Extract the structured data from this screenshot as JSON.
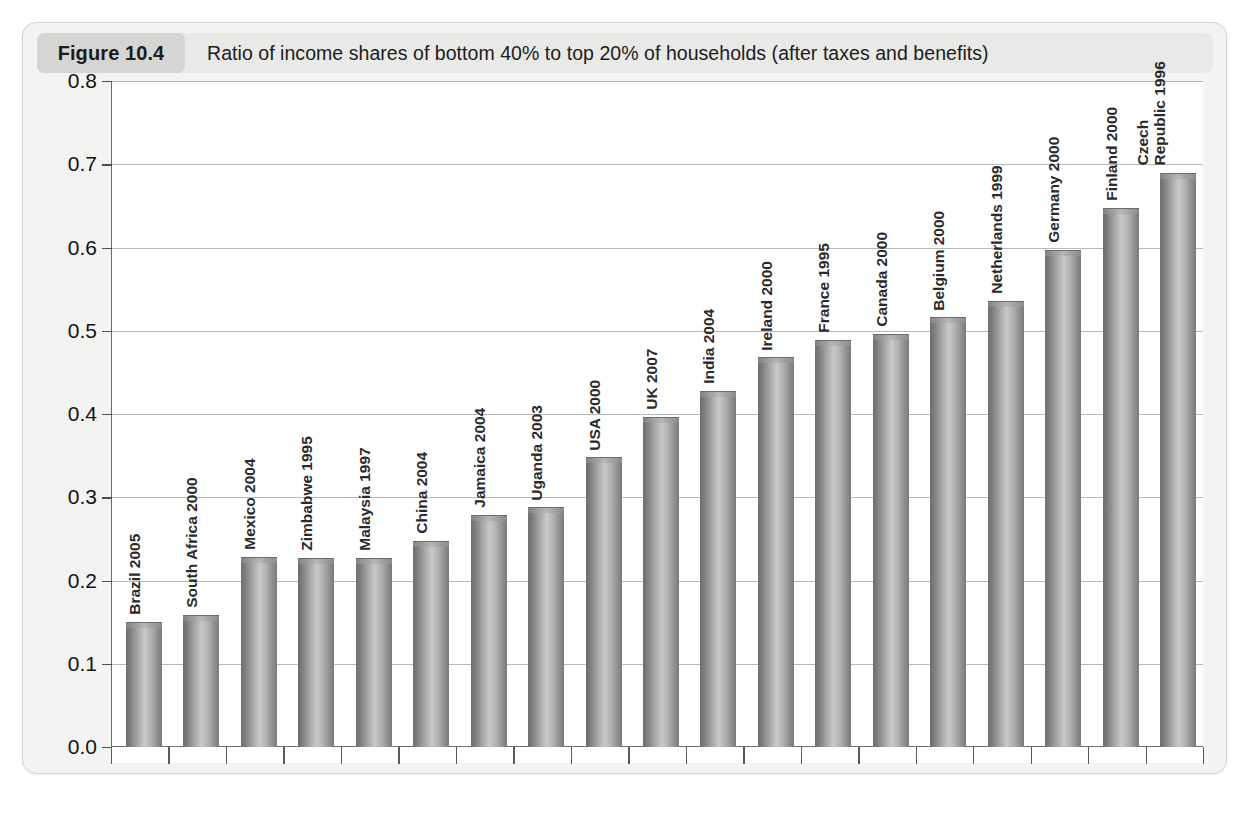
{
  "figure": {
    "badge_label": "Figure 10.4",
    "title": "Ratio of income shares of bottom 40% to top 20% of households (after taxes and benefits)"
  },
  "colors": {
    "card_background": "#f3f3f2",
    "header_background": "#e9e9e7",
    "badge_background": "#d5d5d3",
    "plot_background": "#ffffff",
    "gridline": "#b9b9b9",
    "axis": "#6d6d6d",
    "bar_light": "#c9c9c9",
    "bar_dark": "#6e6e6e",
    "text": "#1c1c1c"
  },
  "chart_data": {
    "type": "bar",
    "title": "Ratio of income shares of bottom 40% to top 20% of households (after taxes and benefits)",
    "xlabel": "",
    "ylabel": "",
    "ylim": [
      0.0,
      0.8
    ],
    "yticks": [
      "0.0",
      "0.1",
      "0.2",
      "0.3",
      "0.4",
      "0.5",
      "0.6",
      "0.7",
      "0.8"
    ],
    "ytick_values": [
      0.0,
      0.1,
      0.2,
      0.3,
      0.4,
      0.5,
      0.6,
      0.7,
      0.8
    ],
    "grid": true,
    "legend": "none",
    "orientation": "vertical",
    "categories": [
      "Brazil 2005",
      "South Africa 2000",
      "Mexico 2004",
      "Zimbabwe 1995",
      "Malaysia 1997",
      "China 2004",
      "Jamaica 2004",
      "Uganda 2003",
      "USA 2000",
      "UK 2007",
      "India 2004",
      "Ireland 2000",
      "France 1995",
      "Canada 2000",
      "Belgium 2000",
      "Netherlands 1999",
      "Germany 2000",
      "Finland 2000",
      "Czech Republic 1996"
    ],
    "category_lines": [
      [
        "Brazil 2005"
      ],
      [
        "South Africa 2000"
      ],
      [
        "Mexico 2004"
      ],
      [
        "Zimbabwe 1995"
      ],
      [
        "Malaysia 1997"
      ],
      [
        "China 2004"
      ],
      [
        "Jamaica 2004"
      ],
      [
        "Uganda 2003"
      ],
      [
        "USA 2000"
      ],
      [
        "UK 2007"
      ],
      [
        "India 2004"
      ],
      [
        "Ireland 2000"
      ],
      [
        "France 1995"
      ],
      [
        "Canada 2000"
      ],
      [
        "Belgium 2000"
      ],
      [
        "Netherlands 1999"
      ],
      [
        "Germany 2000"
      ],
      [
        "Finland 2000"
      ],
      [
        "Czech",
        "Republic 1996"
      ]
    ],
    "values": [
      0.15,
      0.159,
      0.228,
      0.227,
      0.227,
      0.248,
      0.279,
      0.288,
      0.348,
      0.397,
      0.428,
      0.468,
      0.489,
      0.496,
      0.516,
      0.536,
      0.597,
      0.648,
      0.69
    ]
  }
}
